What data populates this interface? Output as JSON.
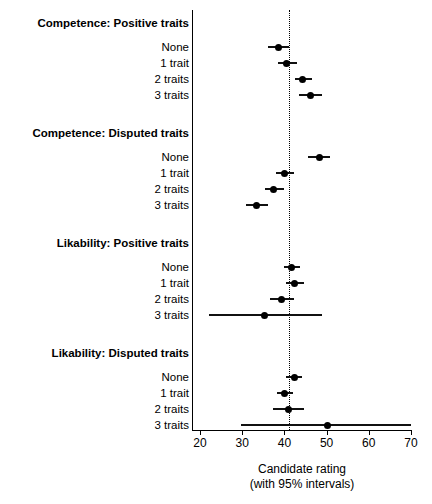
{
  "chart_data": {
    "type": "scatter",
    "title": "",
    "xlabel": "Candidate rating",
    "xlabel_sub": "(with 95% intervals)",
    "ylabel": "",
    "xlim": [
      18,
      72
    ],
    "xticks": [
      20,
      30,
      40,
      50,
      60,
      70
    ],
    "xtick_labels": [
      "20",
      "30",
      "40",
      "50",
      "60",
      "70"
    ],
    "grid": false,
    "legend": "none",
    "reference_line": 41,
    "reference_line_style": "dotted",
    "marker": "filled-circle",
    "error_bars": "95% confidence interval",
    "groups": [
      {
        "label": "Competence: Positive traits",
        "rows": [
          {
            "label": "None",
            "estimate": 38.5,
            "low": 36.2,
            "high": 41.0
          },
          {
            "label": "1 trait",
            "estimate": 40.6,
            "low": 38.4,
            "high": 43.0
          },
          {
            "label": "2 traits",
            "estimate": 44.4,
            "low": 42.4,
            "high": 46.6
          },
          {
            "label": "3 traits",
            "estimate": 46.1,
            "low": 43.5,
            "high": 48.9
          }
        ]
      },
      {
        "label": "Competence: Disputed traits",
        "rows": [
          {
            "label": "None",
            "estimate": 48.2,
            "low": 45.6,
            "high": 50.8
          },
          {
            "label": "1 trait",
            "estimate": 40.1,
            "low": 38.0,
            "high": 42.3
          },
          {
            "label": "2 traits",
            "estimate": 37.5,
            "low": 35.3,
            "high": 39.8
          },
          {
            "label": "3 traits",
            "estimate": 33.5,
            "low": 31.0,
            "high": 36.2
          }
        ]
      },
      {
        "label": "Likability: Positive traits",
        "rows": [
          {
            "label": "None",
            "estimate": 41.8,
            "low": 39.8,
            "high": 43.8
          },
          {
            "label": "1 trait",
            "estimate": 42.5,
            "low": 40.4,
            "high": 44.6
          },
          {
            "label": "2 traits",
            "estimate": 39.4,
            "low": 36.6,
            "high": 42.2
          },
          {
            "label": "3 traits",
            "estimate": 35.2,
            "low": 22.1,
            "high": 48.9
          }
        ]
      },
      {
        "label": "Likability: Disputed traits",
        "rows": [
          {
            "label": "None",
            "estimate": 42.3,
            "low": 40.4,
            "high": 44.2
          },
          {
            "label": "1 trait",
            "estimate": 40.1,
            "low": 38.2,
            "high": 42.0
          },
          {
            "label": "2 traits",
            "estimate": 40.9,
            "low": 37.2,
            "high": 44.6
          },
          {
            "label": "3 traits",
            "estimate": 50.3,
            "low": 29.7,
            "high": 70.0
          }
        ]
      }
    ]
  }
}
